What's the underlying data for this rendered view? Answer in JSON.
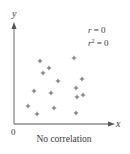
{
  "chart_data": {
    "type": "scatter",
    "title": "No correlation",
    "xlabel": "x",
    "ylabel": "y",
    "origin_label": "0",
    "annotations": [
      "r = 0",
      "r² = 0"
    ],
    "grid": false,
    "legend": null,
    "xlim": [
      0,
      100
    ],
    "ylim": [
      0,
      100
    ],
    "marker": "+",
    "points": [
      {
        "x": 26,
        "y": 63
      },
      {
        "x": 60,
        "y": 66
      },
      {
        "x": 35,
        "y": 56
      },
      {
        "x": 29,
        "y": 51
      },
      {
        "x": 44,
        "y": 43
      },
      {
        "x": 68,
        "y": 45
      },
      {
        "x": 20,
        "y": 33
      },
      {
        "x": 37,
        "y": 31
      },
      {
        "x": 62,
        "y": 36
      },
      {
        "x": 63,
        "y": 27
      },
      {
        "x": 69,
        "y": 29
      },
      {
        "x": 14,
        "y": 18
      },
      {
        "x": 40,
        "y": 16
      },
      {
        "x": 23,
        "y": 10
      },
      {
        "x": 62,
        "y": 11
      }
    ]
  },
  "labels": {
    "y_axis": "y",
    "x_axis": "x",
    "origin": "0",
    "caption": "No correlation",
    "r_label": "r",
    "r_value": "= 0",
    "r2_label": "r",
    "r2_sup": "2",
    "r2_value": "= 0"
  },
  "colors": {
    "axis": "#8a8a8a",
    "marker": "#555555",
    "text": "#3a3a3a"
  }
}
